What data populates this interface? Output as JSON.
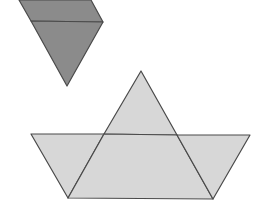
{
  "canvas": {
    "width": 264,
    "height": 209,
    "background": "#ffffff"
  },
  "colors": {
    "dark_fill": "#8b8b8b",
    "light_fill": "#d7d7d7",
    "stroke": "#4a4a4a"
  },
  "shapes": {
    "top_figure": {
      "parallelogram": {
        "points": "19,0 91,0 103,22 31,21"
      },
      "triangle": {
        "points": "31,21 103,22 67,86"
      }
    },
    "boat": {
      "sail_triangle": {
        "points": "141,71 177,135 104,134"
      },
      "hull_left_triangle": {
        "points": "31,134 104,134 68,198"
      },
      "hull_center_parallelogram": {
        "points": "104,134 177,135 213,199 68,198"
      },
      "hull_right_triangle": {
        "points": "177,135 250,135 213,199"
      }
    }
  }
}
